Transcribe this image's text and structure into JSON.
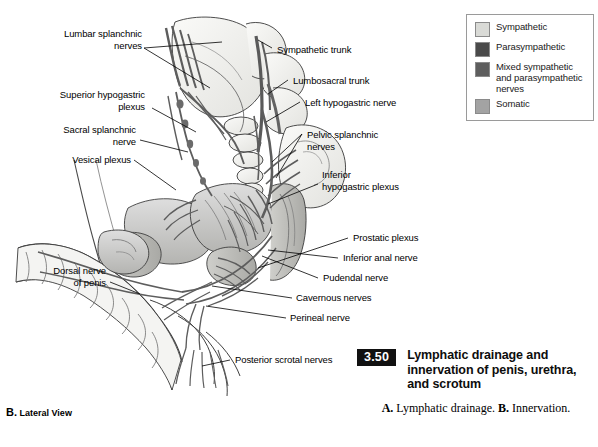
{
  "legend": {
    "items": [
      {
        "label": "Sympathetic",
        "color": "#d9dad6",
        "icon": "color-swatch"
      },
      {
        "label": "Parasympathetic",
        "color": "#4a4a4a",
        "icon": "color-swatch"
      },
      {
        "label": "Mixed sympathetic and parasympathetic nerves",
        "color": "#5e5e5e",
        "icon": "color-swatch"
      },
      {
        "label": "Somatic",
        "color": "#a3a3a3",
        "icon": "color-swatch"
      }
    ]
  },
  "callouts": {
    "lumbar_splanchnic_nerves": "Lumbar splanchnic\nnerves",
    "superior_hypogastric_plexus": "Superior hypogastric\nplexus",
    "sacral_splanchnic_nerve": "Sacral splanchnic\nnerve",
    "vesical_plexus": "Vesical plexus",
    "dorsal_nerve_of_penis": "Dorsal nerve\nof penis",
    "sympathetic_trunk": "Sympathetic trunk",
    "lumbosacral_trunk": "Lumbosacral trunk",
    "left_hypogastric_nerve": "Left hypogastric nerve",
    "pelvic_splanchnic_nerves": "Pelvic splanchnic\nnerves",
    "inferior_hypogastric_plexus": "Inferior\nhypogastric plexus",
    "prostatic_plexus": "Prostatic plexus",
    "inferior_anal_nerve": "Inferior anal nerve",
    "pudendal_nerve": "Pudendal nerve",
    "cavernous_nerves": "Cavernous nerves",
    "perineal_nerve": "Perineal nerve",
    "posterior_scrotal_nerves": "Posterior scrotal nerves"
  },
  "view_caption": {
    "letter": "B.",
    "text": "Lateral View"
  },
  "figure": {
    "number": "3.50",
    "title": "Lymphatic drainage and innervation of penis, urethra, and scrotum",
    "sub_a_letter": "A.",
    "sub_a_text": "Lymphatic drainage.",
    "sub_b_letter": "B.",
    "sub_b_text": "Innervation."
  },
  "colors": {
    "ink": "#000000",
    "fig_number_bg": "#111111",
    "legend_border": "#9a9a9a",
    "nerve_gray": "#6d6d6d",
    "bone_fill": "#efefed",
    "organ_fill": "#d2d2cf"
  }
}
